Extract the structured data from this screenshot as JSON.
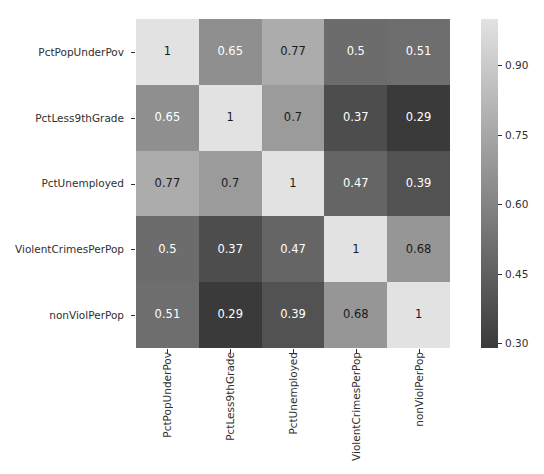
{
  "chart_data": {
    "type": "heatmap",
    "title": "",
    "xlabel": "",
    "ylabel": "",
    "categories": [
      "PctPopUnderPov",
      "PctLess9thGrade",
      "PctUnemployed",
      "ViolentCrimesPerPop",
      "nonViolPerPop"
    ],
    "x_tick_labels": [
      "PctPopUnderPov",
      "PctLess9thGrade",
      "PctUnemployed",
      "ViolentCrimesPerPop",
      "nonViolPerPop"
    ],
    "y_tick_labels": [
      "PctPopUnderPov",
      "PctLess9thGrade",
      "PctUnemployed",
      "ViolentCrimesPerPop",
      "nonViolPerPop"
    ],
    "rows": [
      {
        "label": "PctPopUnderPov",
        "values": [
          1,
          0.65,
          0.77,
          0.5,
          0.51
        ],
        "display": [
          "1",
          "0.65",
          "0.77",
          "0.5",
          "0.51"
        ]
      },
      {
        "label": "PctLess9thGrade",
        "values": [
          0.65,
          1,
          0.7,
          0.37,
          0.29
        ],
        "display": [
          "0.65",
          "1",
          "0.7",
          "0.37",
          "0.29"
        ]
      },
      {
        "label": "PctUnemployed",
        "values": [
          0.77,
          0.7,
          1,
          0.47,
          0.39
        ],
        "display": [
          "0.77",
          "0.7",
          "1",
          "0.47",
          "0.39"
        ]
      },
      {
        "label": "ViolentCrimesPerPop",
        "values": [
          0.5,
          0.37,
          0.47,
          1,
          0.68
        ],
        "display": [
          "0.5",
          "0.37",
          "0.47",
          "1",
          "0.68"
        ]
      },
      {
        "label": "nonViolPerPop",
        "values": [
          0.51,
          0.29,
          0.39,
          0.68,
          1
        ],
        "display": [
          "0.51",
          "0.29",
          "0.39",
          "0.68",
          "1"
        ]
      }
    ],
    "annotations": true,
    "grid": false,
    "colormap": "gray",
    "colorbar": {
      "position": "right",
      "vmin": 0.29,
      "vmax": 1.0,
      "ticks": [
        0.9,
        0.75,
        0.6,
        0.45,
        0.3
      ],
      "tick_labels": [
        "0.90",
        "0.75",
        "0.60",
        "0.45",
        "0.30"
      ]
    }
  },
  "colors": {
    "background": "#ffffff",
    "tick_label": "#303030",
    "dark_text": "#1a1a1a",
    "light_text": "#ffffff",
    "cmap_low": "#000000",
    "cmap_high": "#ffffff"
  }
}
